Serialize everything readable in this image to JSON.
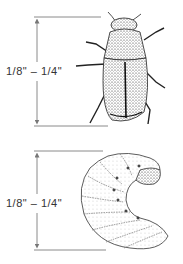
{
  "figure": {
    "adult": {
      "name": "beetle",
      "size_label": "1/8\" – 1/4\""
    },
    "larva": {
      "name": "grub",
      "size_label": "1/8\" – 1/4\""
    },
    "colors": {
      "line": "#808080",
      "ink": "#222222",
      "background": "#ffffff"
    }
  }
}
